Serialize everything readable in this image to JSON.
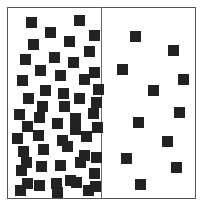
{
  "figure": {
    "frame_color": "#555555",
    "divider_color": "#6a6a6a",
    "square_color": "#222222",
    "square_size": 11
  },
  "panels": [
    {
      "name": "dense",
      "count": 55,
      "squares": [
        [
          26,
          17
        ],
        [
          74,
          15
        ],
        [
          45,
          27
        ],
        [
          89,
          30
        ],
        [
          28,
          39
        ],
        [
          64,
          36
        ],
        [
          84,
          46
        ],
        [
          20,
          54
        ],
        [
          49,
          52
        ],
        [
          68,
          57
        ],
        [
          89,
          67
        ],
        [
          35,
          65
        ],
        [
          55,
          70
        ],
        [
          79,
          74
        ],
        [
          17,
          75
        ],
        [
          40,
          85
        ],
        [
          58,
          88
        ],
        [
          93,
          84
        ],
        [
          23,
          93
        ],
        [
          74,
          93
        ],
        [
          37,
          101
        ],
        [
          59,
          101
        ],
        [
          91,
          97
        ],
        [
          14,
          109
        ],
        [
          34,
          112
        ],
        [
          52,
          118
        ],
        [
          70,
          113
        ],
        [
          88,
          108
        ],
        [
          22,
          121
        ],
        [
          70,
          124
        ],
        [
          92,
          122
        ],
        [
          12,
          133
        ],
        [
          33,
          130
        ],
        [
          57,
          135
        ],
        [
          81,
          131
        ],
        [
          18,
          146
        ],
        [
          38,
          144
        ],
        [
          62,
          141
        ],
        [
          79,
          150
        ],
        [
          21,
          157
        ],
        [
          55,
          160
        ],
        [
          75,
          157
        ],
        [
          91,
          152
        ],
        [
          16,
          165
        ],
        [
          36,
          161
        ],
        [
          65,
          175
        ],
        [
          89,
          168
        ],
        [
          22,
          178
        ],
        [
          51,
          178
        ],
        [
          83,
          185
        ],
        [
          15,
          185
        ],
        [
          34,
          180
        ],
        [
          52,
          187
        ],
        [
          71,
          177
        ],
        [
          90,
          181
        ]
      ]
    },
    {
      "name": "sparse",
      "count": 11,
      "squares": [
        [
          130,
          31
        ],
        [
          168,
          45
        ],
        [
          117,
          64
        ],
        [
          178,
          74
        ],
        [
          148,
          85
        ],
        [
          174,
          107
        ],
        [
          133,
          117
        ],
        [
          162,
          136
        ],
        [
          121,
          153
        ],
        [
          171,
          162
        ],
        [
          135,
          179
        ]
      ]
    }
  ]
}
